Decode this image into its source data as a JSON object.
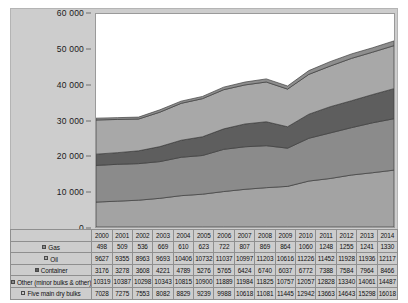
{
  "chart_data": {
    "type": "area",
    "title": "",
    "subtitle": "",
    "xlabel": "",
    "ylabel": "",
    "stacked": true,
    "grid": false,
    "legend_position": "table-left",
    "ylim": [
      0,
      60000
    ],
    "ytick_labels": [
      "0",
      "10 000",
      "20 000",
      "30 000",
      "40 000",
      "50 000",
      "60 000"
    ],
    "ytick_values": [
      0,
      10000,
      20000,
      30000,
      40000,
      50000,
      60000
    ],
    "categories": [
      "2000",
      "2001",
      "2002",
      "2003",
      "2004",
      "2005",
      "2006",
      "2007",
      "2008",
      "2009",
      "2010",
      "2011",
      "2012",
      "2013",
      "2014"
    ],
    "stack_order_bottom_to_top": [
      "Five main dry bulks",
      "Other (minor bulks & other)",
      "Container",
      "Oil",
      "Gas"
    ],
    "series": [
      {
        "name": "Gas",
        "color": "#8e8e8e",
        "values": [
          498,
          509,
          536,
          669,
          610,
          623,
          722,
          807,
          869,
          864,
          1060,
          1248,
          1255,
          1241,
          1330
        ]
      },
      {
        "name": "Oil",
        "color": "#a8a8a8",
        "values": [
          9627,
          9355,
          8963,
          9693,
          10406,
          10732,
          11037,
          10997,
          11203,
          10616,
          11226,
          11452,
          11928,
          11936,
          12117
        ]
      },
      {
        "name": "Container",
        "color": "#5e5e5e",
        "values": [
          3176,
          3278,
          3608,
          4221,
          4789,
          5276,
          5765,
          6424,
          6740,
          6037,
          6772,
          7388,
          7584,
          7964,
          8466
        ]
      },
      {
        "name": "Other (minor bulks & other)",
        "color": "#8b8b8b",
        "values": [
          10319,
          10387,
          10298,
          10343,
          10815,
          10900,
          11889,
          11984,
          11825,
          10757,
          12057,
          12828,
          13340,
          14061,
          14487
        ]
      },
      {
        "name": "Five main dry bulks",
        "color": "#a3a3a3",
        "values": [
          7028,
          7275,
          7553,
          8082,
          8829,
          9239,
          9988,
          10618,
          11081,
          11445,
          12942,
          13663,
          14643,
          15298,
          16018
        ]
      }
    ]
  },
  "table": {
    "year_header": [
      "2000",
      "2001",
      "2002",
      "2003",
      "2004",
      "2005",
      "2006",
      "2007",
      "2008",
      "2009",
      "2010",
      "2011",
      "2012",
      "2013",
      "2014"
    ],
    "rows": [
      {
        "label": "Gas",
        "swatch_color": "#8e8e8e",
        "values": [
          "498",
          "509",
          "536",
          "669",
          "610",
          "623",
          "722",
          "807",
          "869",
          "864",
          "1060",
          "1248",
          "1255",
          "1241",
          "1330"
        ]
      },
      {
        "label": "Oil",
        "swatch_color": "#a8a8a8",
        "values": [
          "9627",
          "9355",
          "8963",
          "9693",
          "10406",
          "10732",
          "11037",
          "10997",
          "11203",
          "10616",
          "11226",
          "11452",
          "11928",
          "11936",
          "12117"
        ]
      },
      {
        "label": "Container",
        "swatch_color": "#5e5e5e",
        "values": [
          "3176",
          "3278",
          "3608",
          "4221",
          "4789",
          "5276",
          "5765",
          "6424",
          "6740",
          "6037",
          "6772",
          "7388",
          "7584",
          "7964",
          "8466"
        ]
      },
      {
        "label": "Other (minor bulks & other)",
        "swatch_color": "#8b8b8b",
        "values": [
          "10319",
          "10387",
          "10298",
          "10343",
          "10815",
          "10900",
          "11889",
          "11984",
          "11825",
          "10757",
          "12057",
          "12828",
          "13340",
          "14061",
          "14487"
        ]
      },
      {
        "label": "Five main dry bulks",
        "swatch_color": "#c9c9c9",
        "values": [
          "7028",
          "7275",
          "7553",
          "8082",
          "8829",
          "9239",
          "9988",
          "10618",
          "11081",
          "11445",
          "12942",
          "13663",
          "14643",
          "15298",
          "16018"
        ]
      }
    ]
  },
  "colors": {
    "plate_background": "#cdcdcd",
    "plot_background": "#ffffff",
    "axis_text": "#1a1a1a",
    "grid_border": "#9a9a9a",
    "table_border": "#8f8f8f"
  }
}
